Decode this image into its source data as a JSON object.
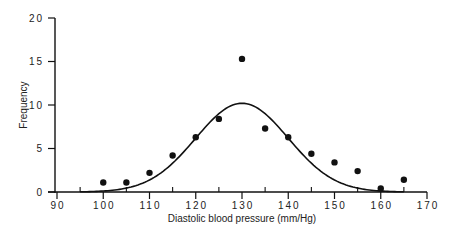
{
  "chart_data": {
    "type": "scatter",
    "title": "",
    "xlabel": "Diastolic blood pressure (mm/Hg)",
    "ylabel": "Frequency",
    "xlim": [
      90,
      170
    ],
    "ylim": [
      0,
      20
    ],
    "x_ticks": [
      90,
      100,
      110,
      120,
      130,
      140,
      150,
      160,
      170
    ],
    "x_minor_ticks": [
      95,
      105,
      115,
      125,
      135,
      145,
      155,
      165
    ],
    "y_ticks": [
      0,
      5,
      10,
      15,
      20
    ],
    "grid": false,
    "legend": null,
    "series": [
      {
        "name": "Observed frequency",
        "kind": "points",
        "x": [
          100,
          105,
          110,
          115,
          120,
          125,
          130,
          135,
          140,
          145,
          150,
          155,
          160,
          165
        ],
        "y": [
          1.1,
          1.1,
          2.2,
          4.2,
          6.3,
          8.4,
          15.3,
          7.3,
          6.3,
          4.4,
          3.4,
          2.4,
          0.4,
          1.4
        ]
      },
      {
        "name": "Fitted normal curve",
        "kind": "line",
        "mean": 130,
        "peak": 10.2,
        "sd": 10,
        "x_range": [
          95,
          165
        ]
      }
    ]
  }
}
